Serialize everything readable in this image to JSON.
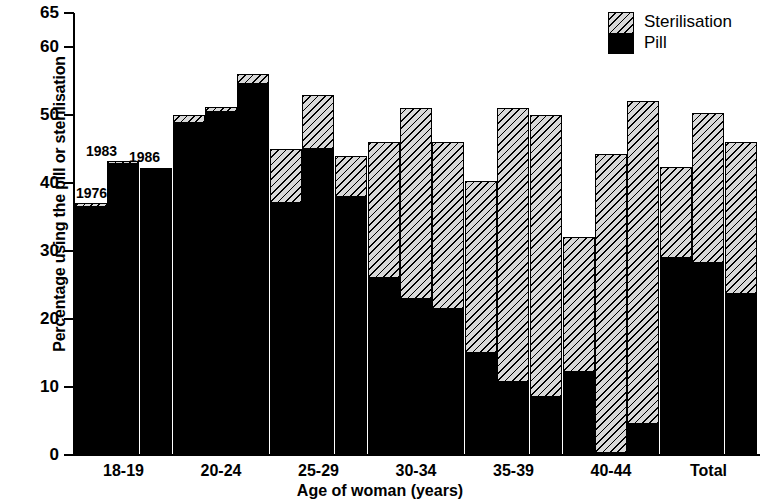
{
  "chart_data": {
    "type": "bar",
    "subtype": "grouped-stacked",
    "title": "",
    "xlabel": "Age of woman (years)",
    "ylabel": "Percentage using the pill or sterilisation",
    "ylim": [
      0,
      65
    ],
    "yticks": [
      0,
      10,
      20,
      30,
      40,
      50,
      60,
      65
    ],
    "ytick_labels": [
      "0",
      "10",
      "20",
      "30",
      "40",
      "50",
      "60",
      "65"
    ],
    "grid": false,
    "legend_position": "top-right",
    "legend": [
      "Sterilisation",
      "Pill"
    ],
    "series_labels": [
      "1976",
      "1983",
      "1986"
    ],
    "annotations": [
      "1976",
      "1983",
      "1986"
    ],
    "categories": [
      "18-19",
      "20-24",
      "25-29",
      "30-34",
      "35-39",
      "40-44",
      "Total"
    ],
    "series": [
      {
        "name": "Pill",
        "color": "#000000",
        "values_by_year": {
          "1976": [
            36.5,
            48.8,
            37.0,
            26.0,
            15.0,
            12.2,
            29.0
          ],
          "1983": [
            43.0,
            50.5,
            45.0,
            23.0,
            10.7,
            0.3,
            28.2
          ],
          "1986": [
            42.0,
            54.5,
            38.0,
            21.5,
            8.5,
            4.5,
            23.7
          ]
        }
      },
      {
        "name": "Sterilisation",
        "color": "#d8d8d8",
        "values_by_year": {
          "1976": [
            0.5,
            1.2,
            8.0,
            20.0,
            25.3,
            19.8,
            13.3
          ],
          "1983": [
            0.3,
            0.7,
            8.0,
            28.0,
            40.3,
            44.0,
            22.1
          ],
          "1986": [
            0.2,
            1.5,
            6.0,
            24.5,
            41.5,
            47.5,
            22.3
          ]
        }
      }
    ],
    "totals_by_year": {
      "1976": [
        37.0,
        50.0,
        45.0,
        46.0,
        40.3,
        32.0,
        42.3
      ],
      "1983": [
        43.3,
        51.2,
        53.0,
        51.0,
        51.0,
        44.3,
        50.3
      ],
      "1986": [
        42.2,
        56.0,
        44.0,
        46.0,
        50.0,
        52.0,
        46.0
      ]
    }
  },
  "axes": {
    "y_title": "Percentage using the pill or sterilisation",
    "x_title": "Age of woman (years)",
    "y_labels": [
      "65",
      "60",
      "50",
      "40",
      "30",
      "20",
      "10",
      "0"
    ],
    "x_labels": [
      "18-19",
      "20-24",
      "25-29",
      "30-34",
      "35-39",
      "40-44",
      "Total"
    ]
  },
  "legend": {
    "sterilisation_label": "Sterilisation",
    "pill_label": "Pill"
  },
  "year_annotations": {
    "first": "1976",
    "second": "1983",
    "third": "1986"
  },
  "colors": {
    "pill": "#000000",
    "sterilisation_fill": "#d8d8d8",
    "axis": "#000000",
    "background": "#ffffff"
  }
}
